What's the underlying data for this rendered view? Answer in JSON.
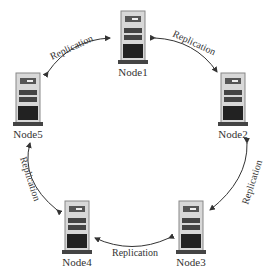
{
  "diagram": {
    "nodes": [
      {
        "id": "node1",
        "label": "Node1",
        "x": 118,
        "y": 10
      },
      {
        "id": "node2",
        "label": "Node2",
        "x": 218,
        "y": 72
      },
      {
        "id": "node3",
        "label": "Node3",
        "x": 176,
        "y": 200
      },
      {
        "id": "node4",
        "label": "Node4",
        "x": 62,
        "y": 200
      },
      {
        "id": "node5",
        "label": "Node5",
        "x": 13,
        "y": 72
      }
    ],
    "edges": [
      {
        "from": "node1",
        "to": "node2",
        "label": "Replication"
      },
      {
        "from": "node2",
        "to": "node3",
        "label": "Replication"
      },
      {
        "from": "node3",
        "to": "node4",
        "label": "Replication"
      },
      {
        "from": "node4",
        "to": "node5",
        "label": "Replication"
      },
      {
        "from": "node5",
        "to": "node1",
        "label": "Replication"
      }
    ],
    "colors": {
      "arrow": "#333333",
      "text": "#333333",
      "server_dark": "#222222",
      "server_light": "#cfcfcf"
    }
  }
}
